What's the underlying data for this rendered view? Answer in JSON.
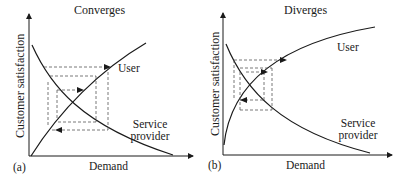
{
  "panels": [
    {
      "id": "a",
      "panel_label": "(a)",
      "title": "Converges",
      "x_axis_label": "Demand",
      "y_axis_label": "Customer satisfaction",
      "curves": [
        {
          "name": "User",
          "shape": "increasing, slightly concave"
        },
        {
          "name": "Service provider",
          "shape": "decreasing, convex"
        }
      ],
      "curve_labels": {
        "user": "User",
        "provider_line1": "Service",
        "provider_line2": "provider"
      },
      "behavior": "Cobweb iterations converge toward the intersection"
    },
    {
      "id": "b",
      "panel_label": "(b)",
      "title": "Diverges",
      "x_axis_label": "Demand",
      "y_axis_label": "Customer satisfaction",
      "curves": [
        {
          "name": "User",
          "shape": "increasing, strongly concave"
        },
        {
          "name": "Service provider",
          "shape": "decreasing, convex"
        }
      ],
      "curve_labels": {
        "user": "User",
        "provider_line1": "Service",
        "provider_line2": "provider"
      },
      "behavior": "Cobweb iterations diverge away from the intersection"
    }
  ],
  "colors": {
    "line": "#1a1a1a",
    "dash": "#555555",
    "background": "#ffffff"
  }
}
